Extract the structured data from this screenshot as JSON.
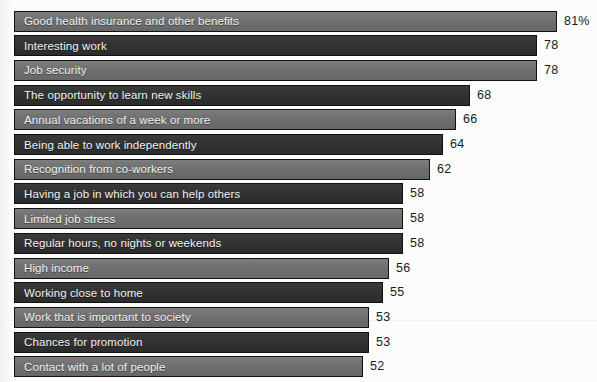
{
  "clipped_header": {
    "note": "illegible clipped text at top edge of scan",
    "ghost_text": "····························"
  },
  "colors": {
    "bar_light": "#6f6f6f",
    "bar_dark": "#323232",
    "bar_outline": "#111111",
    "label_text": "#f2f2f2",
    "value_text": "#1b1b1b",
    "background": "#fcfcfc"
  },
  "chart_data": {
    "type": "bar",
    "orientation": "horizontal",
    "title": "",
    "subtitle": "",
    "xlabel": "",
    "ylabel": "",
    "xlim": [
      0,
      81
    ],
    "grid": false,
    "legend": null,
    "value_suffix_first": "%",
    "categories": [
      "Good health insurance and other benefits",
      "Interesting work",
      "Job security",
      "The opportunity to learn new skills",
      "Annual vacations of a week or more",
      "Being able to work independently",
      "Recognition from co-workers",
      "Having a job in which you can help others",
      "Limited job stress",
      "Regular hours, no nights or weekends",
      "High income",
      "Working close to home",
      "Work that is important to society",
      "Chances for promotion",
      "Contact with a lot of people"
    ],
    "values": [
      81,
      78,
      78,
      68,
      66,
      64,
      62,
      58,
      58,
      58,
      56,
      55,
      53,
      53,
      52
    ],
    "value_labels": [
      "81%",
      "78",
      "78",
      "68",
      "66",
      "64",
      "62",
      "58",
      "58",
      "58",
      "56",
      "55",
      "53",
      "53",
      "52"
    ],
    "bar_shades": [
      "light",
      "dark",
      "light",
      "dark",
      "light",
      "dark",
      "light",
      "dark",
      "light",
      "dark",
      "light",
      "dark",
      "light",
      "dark",
      "light"
    ]
  }
}
